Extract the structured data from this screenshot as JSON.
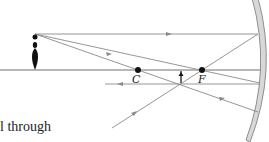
{
  "diagram": {
    "colors": {
      "ray": "#8a8a8a",
      "axis": "#6f6f6f",
      "mirror_fill": "#d8d8d8",
      "mirror_edge": "#777777",
      "point": "#111111",
      "object": "#111111"
    },
    "points": [
      {
        "id": "C",
        "label": "C"
      },
      {
        "id": "F",
        "label": "F"
      }
    ],
    "object": {
      "type": "upright-figure"
    },
    "image": {
      "type": "inverted-small-arrow",
      "location": "between C and F"
    },
    "rays": [
      {
        "name": "parallel-ray",
        "description": "parallel to axis, reflects through F"
      },
      {
        "name": "focal-ray",
        "description": "through F, reflects parallel to axis"
      },
      {
        "name": "center-ray",
        "description": "through C, reflects back on itself"
      }
    ]
  },
  "caption": {
    "text": "l through"
  }
}
